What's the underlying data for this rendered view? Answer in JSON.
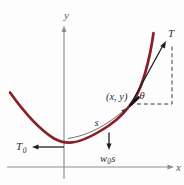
{
  "figure": {
    "colors": {
      "curve": "#8b1e26",
      "axis": "#8f8f8f",
      "ink": "#2e2e2e",
      "muted_ink": "#5a5a5a",
      "bg": "#fdfdfd"
    }
  },
  "labels": {
    "y_axis": "y",
    "x_axis": "x",
    "tension_upper": "T",
    "tension_lower_base": "T",
    "tension_lower_sub": "0",
    "point": "(x, y)",
    "angle_theta": "θ",
    "arc_length": "s",
    "weight_base": "w",
    "weight_sub": "0",
    "weight_mult": "s"
  }
}
